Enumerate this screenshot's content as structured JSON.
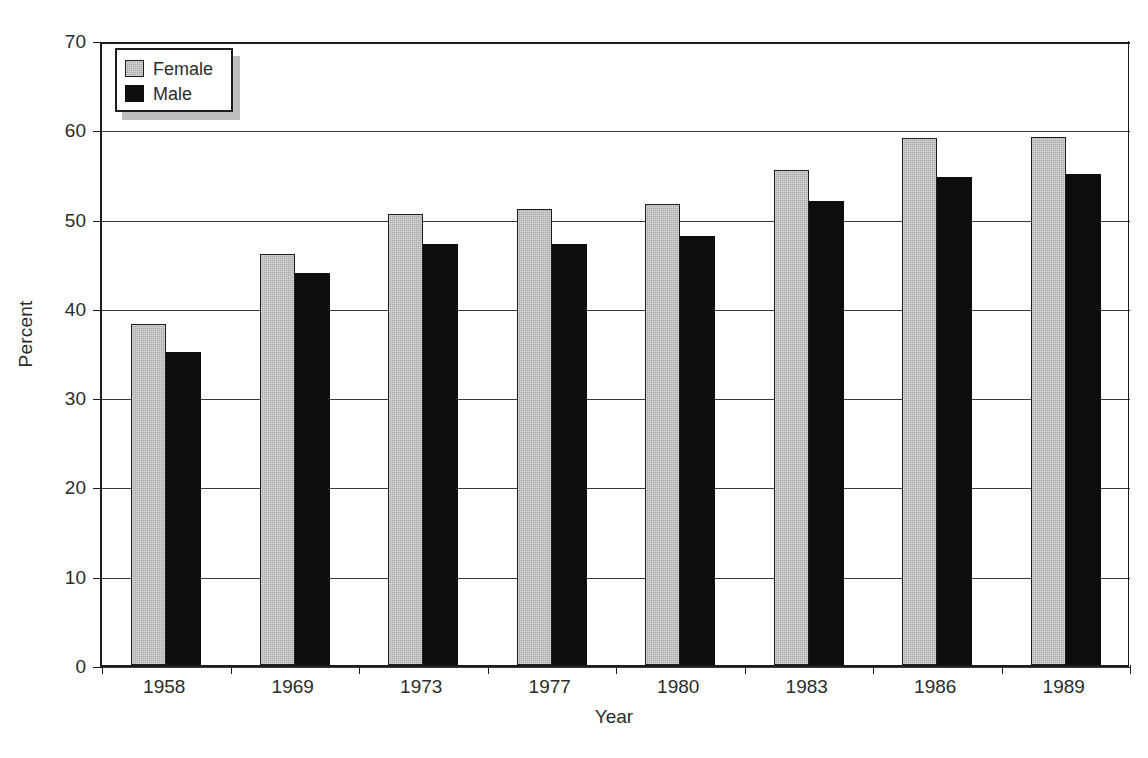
{
  "chart_data": {
    "type": "bar",
    "title": "",
    "xlabel": "Year",
    "ylabel": "Percent",
    "categories": [
      "1958",
      "1969",
      "1973",
      "1977",
      "1980",
      "1983",
      "1986",
      "1989"
    ],
    "series": [
      {
        "name": "Female",
        "color": "#a9a9a9",
        "values": [
          38.2,
          46.0,
          50.5,
          51.1,
          51.6,
          55.4,
          59.0,
          59.1
        ]
      },
      {
        "name": "Male",
        "color": "#0d0d0d",
        "values": [
          35.1,
          43.9,
          47.2,
          47.2,
          48.0,
          52.0,
          54.7,
          55.0
        ]
      }
    ],
    "ylim": [
      0,
      70
    ],
    "yticks": [
      "0",
      "10",
      "20",
      "30",
      "40",
      "50",
      "60",
      "70"
    ],
    "ytick_step": 10,
    "grid": true,
    "legend_position": "top-left",
    "legend_entries": [
      "Female",
      "Male"
    ]
  }
}
